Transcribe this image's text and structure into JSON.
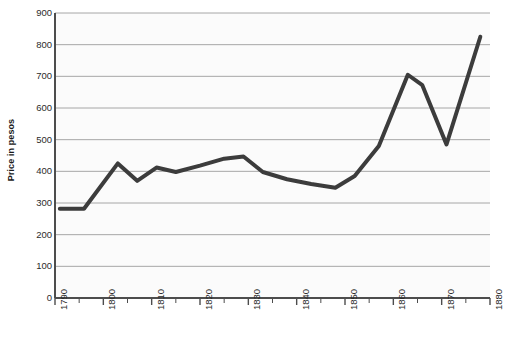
{
  "chart_data": {
    "type": "line",
    "title": "",
    "subtitle": "",
    "xlabel": "",
    "ylabel": "Price in pesos",
    "xlim": [
      1790,
      1880
    ],
    "ylim": [
      0,
      900
    ],
    "ytick_values": [
      0,
      100,
      200,
      300,
      400,
      500,
      600,
      700,
      800,
      900
    ],
    "ytick_labels": [
      "0",
      "100",
      "200",
      "300",
      "400",
      "500",
      "600",
      "700",
      "800",
      "900"
    ],
    "xtick_values": [
      1790,
      1800,
      1810,
      1820,
      1830,
      1840,
      1850,
      1860,
      1870,
      1880
    ],
    "xtick_labels": [
      "1790",
      "1800",
      "1810",
      "1820",
      "1830",
      "1840",
      "1850",
      "1860",
      "1870",
      "1880"
    ],
    "xminor_values": [
      1795,
      1805,
      1815,
      1825,
      1835,
      1845,
      1855,
      1865,
      1875
    ],
    "grid": "horizontal",
    "legend": "none",
    "series": [
      {
        "name": "Price in pesos",
        "color": "#3c3c3c",
        "x": [
          1791,
          1796,
          1803,
          1807,
          1811,
          1815,
          1820,
          1825,
          1829,
          1833,
          1838,
          1843,
          1848,
          1852,
          1857,
          1863,
          1866,
          1871,
          1878
        ],
        "values": [
          282,
          282,
          425,
          370,
          412,
          398,
          418,
          440,
          447,
          398,
          375,
          360,
          348,
          385,
          480,
          705,
          672,
          485,
          825
        ]
      }
    ]
  },
  "style": {
    "line_color": "#3c3c3c",
    "grid_color": "#a6a6a6",
    "axis_color": "#4d4d4d",
    "plot_background": "#fbfbfb",
    "page_background": "#ffffff",
    "text_color": "#2b2b2b"
  },
  "geometry": {
    "plot_left": 55,
    "plot_right": 490,
    "plot_top": 13,
    "plot_bottom": 298
  }
}
